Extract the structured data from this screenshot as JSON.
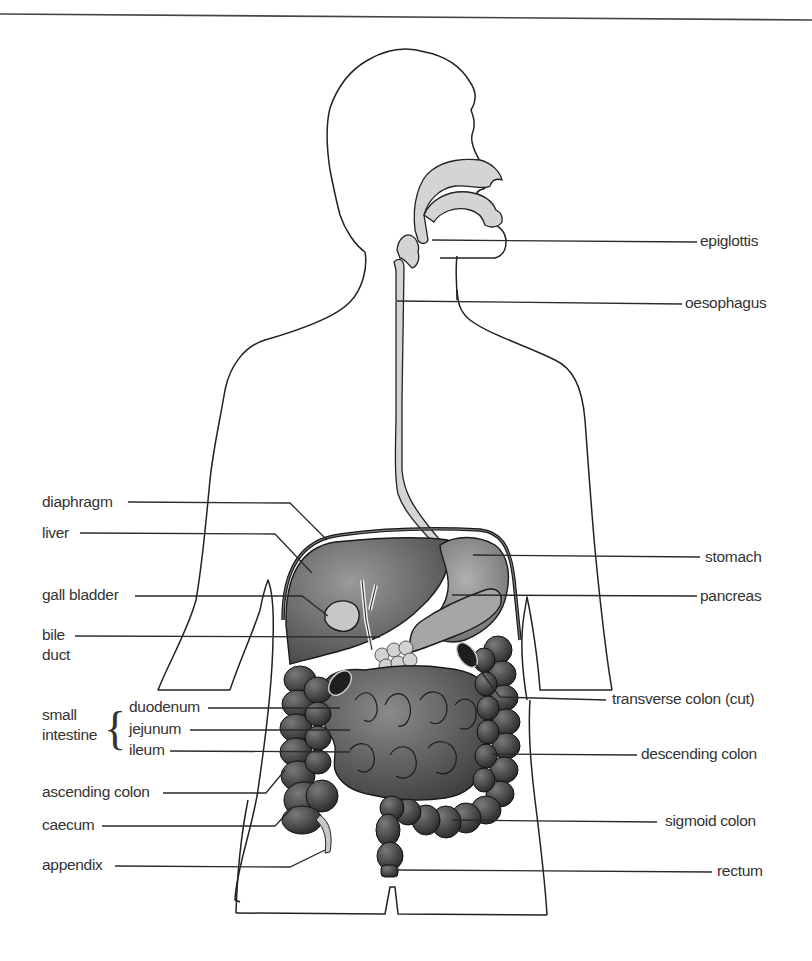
{
  "diagram": {
    "colors": {
      "outline": "#222222",
      "airway_fill": "#d4d4d4",
      "liver": "#6e6e6e",
      "stomach": "#8c8c8c",
      "pancreas": "#a6a6a6",
      "gall_bladder_fill": "#d9d9d9",
      "intestine": "#5a5a5a",
      "colon": "#4a4a4a",
      "cut_colon": "#1e1e1e",
      "label_text": "#333333"
    },
    "labels_left": {
      "diaphragm": "diaphragm",
      "liver": "liver",
      "gall_bladder": "gall bladder",
      "bile_duct_line1": "bile",
      "bile_duct_line2": "duct",
      "small_intestine_line1": "small",
      "small_intestine_line2": "intestine",
      "brace": "{",
      "duodenum": "duodenum",
      "jejunum": "jejunum",
      "ileum": "ileum",
      "ascending_colon": "ascending colon",
      "caecum": "caecum",
      "appendix": "appendix"
    },
    "labels_right": {
      "epiglottis": "epiglottis",
      "oesophagus": "oesophagus",
      "stomach": "stomach",
      "pancreas": "pancreas",
      "transverse_colon": "transverse colon (cut)",
      "descending_colon": "descending colon",
      "sigmoid_colon": "sigmoid colon",
      "rectum": "rectum"
    }
  }
}
